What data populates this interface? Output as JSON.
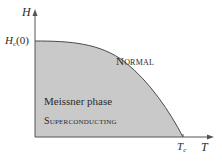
{
  "diagram": {
    "type": "phase-diagram",
    "axes": {
      "y": {
        "label": "H"
      },
      "x": {
        "label": "T"
      }
    },
    "ticks": {
      "y_tick": {
        "base": "H",
        "sub": "c",
        "suffix": "(0)"
      },
      "x_tick": {
        "base": "T",
        "sub": "c"
      }
    },
    "regions": {
      "normal": "Normal",
      "meissner": "Meissner phase",
      "superconducting": "Superconducting"
    },
    "colors": {
      "fill": "#c9c9c9",
      "line": "#4a4a4a",
      "text": "#2a2a2a",
      "background": "#ffffff"
    }
  }
}
